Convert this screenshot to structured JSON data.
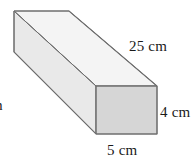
{
  "figure": {
    "type": "rectangular-prism-diagram",
    "shape_name": "rectangular prism",
    "fill_front": "#d6d6d6",
    "fill_top": "#f2f2f2",
    "fill_side": "#e8e8e8",
    "stroke": "#6e6e6e",
    "background": "#ffffff"
  },
  "labels": {
    "length": "25 cm",
    "height": "4 cm",
    "width": "5 cm",
    "depth_clipped": "m"
  },
  "measurements": {
    "length_value": 25,
    "height_value": 4,
    "width_value": 5,
    "unit": "cm"
  }
}
